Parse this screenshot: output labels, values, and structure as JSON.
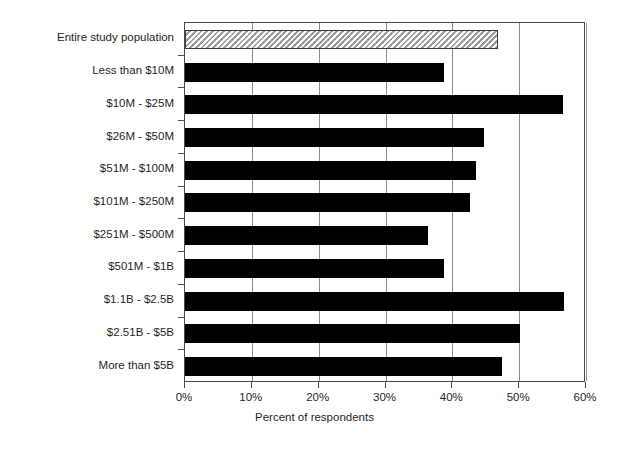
{
  "chart_data": {
    "type": "bar",
    "orientation": "horizontal",
    "title": "",
    "xlabel": "Percent of respondents",
    "ylabel": "",
    "xlim": [
      0,
      60
    ],
    "xtick_labels": [
      "0%",
      "10%",
      "20%",
      "30%",
      "40%",
      "50%",
      "60%"
    ],
    "xtick_values": [
      0,
      10,
      20,
      30,
      40,
      50,
      60
    ],
    "grid": true,
    "grid_axis": "x",
    "legend": null,
    "categories": [
      "Entire study population",
      "Less than $10M",
      "$10M - $25M",
      "$26M - $50M",
      "$51M - $100M",
      "$101M - $250M",
      "$251M - $500M",
      "$501M - $1B",
      "$1.1B - $2.5B",
      "$2.51B - $5B",
      "More than $5B"
    ],
    "values": [
      46.8,
      38.7,
      56.5,
      44.8,
      43.6,
      42.6,
      36.4,
      38.7,
      56.7,
      50.1,
      47.4
    ],
    "bar_styles": [
      "hatched",
      "solid",
      "solid",
      "solid",
      "solid",
      "solid",
      "solid",
      "solid",
      "solid",
      "solid",
      "solid"
    ],
    "colors": {
      "solid_bar": "#000000",
      "hatched_bar_fill": "#c9c9c9",
      "hatched_bar_border": "#3c3c3c",
      "gridline": "#8c8c8c",
      "axis": "#4a4a4a",
      "text": "#1f1f1f",
      "background": "#ffffff"
    }
  }
}
